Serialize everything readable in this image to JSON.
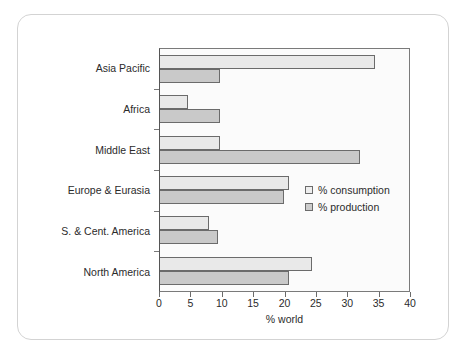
{
  "chart_data": {
    "type": "bar",
    "orientation": "horizontal",
    "title": "",
    "xlabel": "% world",
    "ylabel": "",
    "xlim": [
      0,
      40
    ],
    "xticks": [
      0,
      5,
      10,
      15,
      20,
      25,
      30,
      35,
      40
    ],
    "grid": false,
    "legend_position": "middle-right",
    "categories": [
      "Asia Pacific",
      "Africa",
      "Middle East",
      "Europe & Eurasia",
      "S. & Cent. America",
      "North America"
    ],
    "series": [
      {
        "name": "% consumption",
        "color": "#e9e9e9",
        "values": [
          34.2,
          4.4,
          9.5,
          20.5,
          7.8,
          24.3
        ]
      },
      {
        "name": "% production",
        "color": "#c9c9c9",
        "values": [
          9.6,
          9.5,
          31.8,
          19.8,
          9.3,
          20.6
        ]
      }
    ]
  }
}
